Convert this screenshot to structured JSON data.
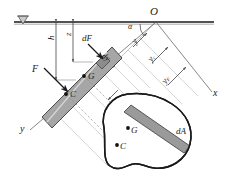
{
  "figure": {
    "canvas": {
      "width": 231,
      "height": 187
    },
    "colors": {
      "line": "#1a1a1a",
      "plate_fill": "#9a9a9a",
      "plate_edge": "#4d4d4d",
      "construction": "#b0b0b0",
      "dashed": "#8c8c8c",
      "background": "#ffffff"
    }
  },
  "labels": {
    "origin": "O",
    "angle": "α",
    "force_resultant": "F",
    "force_element": "dF",
    "depth_centroid": "h",
    "depth_element": "z",
    "element_width": "dy",
    "y_element": "y",
    "y_centroid": "y",
    "y_centroid_sub": "c",
    "y_pressure": "y",
    "y_pressure_sub": "F",
    "centroid_plate": "G",
    "center_pressure_plate": "C",
    "centroid_shape": "G",
    "center_pressure_shape": "C",
    "element_area": "dA",
    "axis_x": "x",
    "axis_y": "y"
  },
  "elements": {
    "free_surface": "free-surface-line",
    "water_symbol": "water-surface-triangle-icon",
    "plate_edge_view": "inclined-plate-edge-view",
    "plate_true_shape": "plate-true-shape-outline",
    "strip_element": "elemental-strip-dA",
    "dimension_lines": "dimension-lines-group",
    "projection_lines": "projection-construction-lines",
    "axis_line_x": "axis-x-line",
    "axis_line_y": "axis-y-line"
  }
}
